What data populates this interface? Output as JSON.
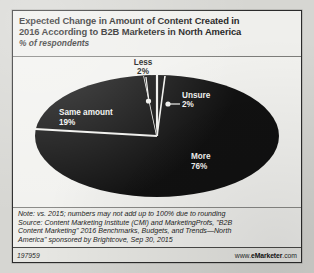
{
  "header": {
    "title_line1": "Expected Change in Amount of Content Created in",
    "title_line2": "2016 According to B2B Marketers in North America",
    "subtitle": "% of respondents"
  },
  "chart_data": {
    "type": "pie",
    "title": "Expected Change in Amount of Content Created in 2016 According to B2B Marketers in North America",
    "subtitle": "% of respondents",
    "unit": "% of respondents",
    "categories": [
      "More",
      "Same amount",
      "Less",
      "Unsure"
    ],
    "values": [
      76,
      19,
      2,
      2
    ],
    "labels": [
      {
        "name": "More",
        "value": "76%",
        "value_num": 76,
        "placement": "inside"
      },
      {
        "name": "Same amount",
        "value": "19%",
        "value_num": 19,
        "placement": "inside"
      },
      {
        "name": "Less",
        "value": "2%",
        "value_num": 2,
        "placement": "outside-callout"
      },
      {
        "name": "Unsure",
        "value": "2%",
        "value_num": 2,
        "placement": "inside-callout"
      }
    ],
    "legend": "none",
    "grid": false,
    "colors": {
      "slice_fill": "#111111",
      "separator": "#f2f2ef",
      "inside_text": "#f4f4f1",
      "outside_text": "#121212",
      "plot_background": "#f2f2ef"
    },
    "start_angle_deg": 0,
    "direction": "clockwise",
    "shape": "flattened-ellipse"
  },
  "labels": {
    "less_name": "Less",
    "less_value": "2%",
    "unsure_name": "Unsure",
    "unsure_value": "2%",
    "same_name": "Same amount",
    "same_value": "19%",
    "more_name": "More",
    "more_value": "76%"
  },
  "notes": {
    "line1": "Note: vs. 2015; numbers may not add up to 100% due to rounding",
    "line2": "Source: Content Marketing Institute (CMI) and MarketingProfs, \"B2B",
    "line3": "Content Marketing\" 2016 Benchmarks, Budgets, and Trends—North",
    "line4": "America\" sponsored by Brightcove, Sep 30, 2015"
  },
  "footer": {
    "chart_id": "197959",
    "brand_prefix": "www.",
    "brand_name": "eMarketer",
    "brand_suffix": ".com"
  }
}
